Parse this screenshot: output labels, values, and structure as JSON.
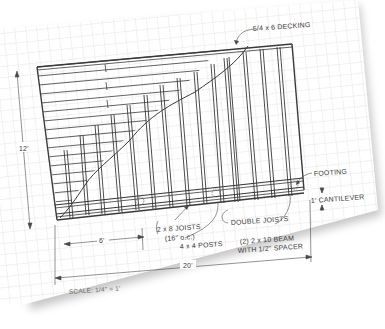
{
  "drawing": {
    "type": "deck framing plan",
    "labels": {
      "decking": "5/4 x 6 DECKING",
      "height_dim": "12'",
      "footing": "FOOTING",
      "cantilever": "1' CANTILEVER",
      "post_spacing": "6'",
      "joists_line1": "2 x 8 JOISTS",
      "joists_line2": "(16\" o.c.)",
      "posts": "4 x 4 POSTS",
      "double_joists": "DOUBLE JOISTS",
      "beam_line1": "(2) 2 x 10 BEAM",
      "beam_line2": "WITH 1/2\" SPACER",
      "width_dim": "20'",
      "scale": "SCALE: 1/4\" = 1'"
    },
    "colors": {
      "paper": "#ffffff",
      "grid": "#d9d9d9",
      "ink": "#3a3a3a",
      "shadow": "#bdbdbd"
    }
  }
}
